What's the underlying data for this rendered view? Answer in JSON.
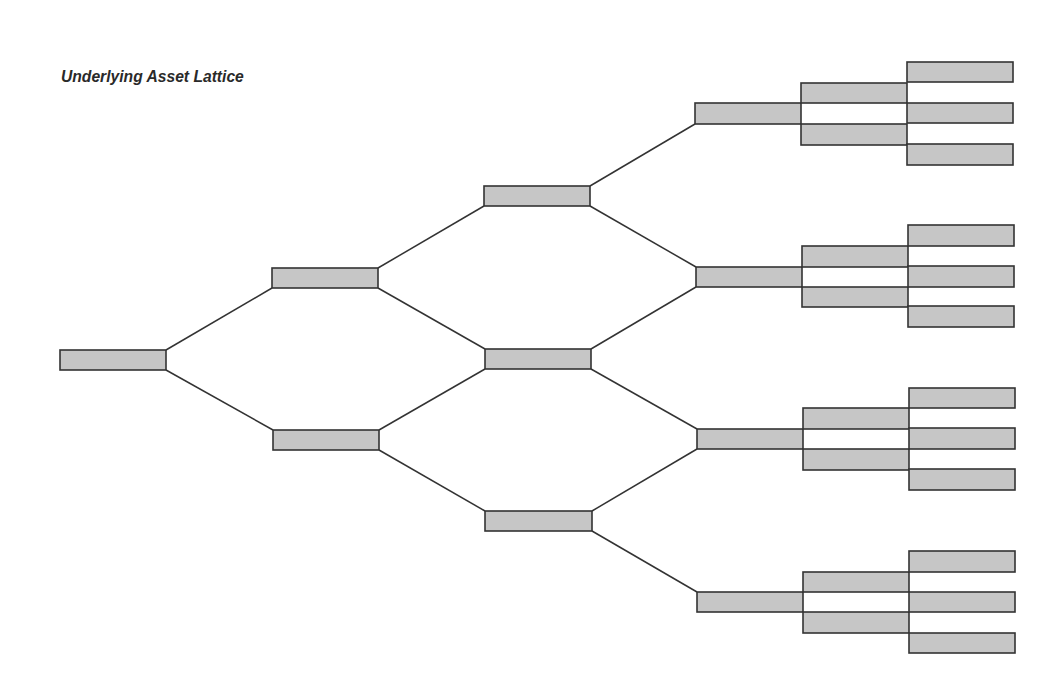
{
  "title": "Underlying Asset Lattice",
  "colors": {
    "node_fill": "#c6c6c6",
    "node_stroke": "#333333",
    "edge": "#333333",
    "background": "#ffffff"
  },
  "lattice": {
    "type": "binomial-to-trinomial tree",
    "levels": 6,
    "nodes": [
      {
        "id": "L0",
        "x": 60,
        "y": 350,
        "w": 106,
        "h": 20
      },
      {
        "id": "L1-up",
        "x": 272,
        "y": 268,
        "w": 106,
        "h": 20
      },
      {
        "id": "L1-down",
        "x": 273,
        "y": 430,
        "w": 106,
        "h": 20
      },
      {
        "id": "L2-up",
        "x": 484,
        "y": 186,
        "w": 106,
        "h": 20
      },
      {
        "id": "L2-mid",
        "x": 485,
        "y": 349,
        "w": 106,
        "h": 20
      },
      {
        "id": "L2-down",
        "x": 485,
        "y": 511,
        "w": 107,
        "h": 20
      },
      {
        "id": "L3-1",
        "x": 695,
        "y": 103,
        "w": 106,
        "h": 21
      },
      {
        "id": "L3-2",
        "x": 696,
        "y": 267,
        "w": 106,
        "h": 20
      },
      {
        "id": "L3-3",
        "x": 697,
        "y": 429,
        "w": 106,
        "h": 20
      },
      {
        "id": "L3-4",
        "x": 697,
        "y": 592,
        "w": 106,
        "h": 20
      },
      {
        "id": "L4-1a",
        "x": 801,
        "y": 83,
        "w": 106,
        "h": 20
      },
      {
        "id": "L4-1b",
        "x": 801,
        "y": 124,
        "w": 106,
        "h": 21
      },
      {
        "id": "L4-2a",
        "x": 802,
        "y": 246,
        "w": 106,
        "h": 21
      },
      {
        "id": "L4-2b",
        "x": 802,
        "y": 287,
        "w": 106,
        "h": 20
      },
      {
        "id": "L4-3a",
        "x": 803,
        "y": 408,
        "w": 106,
        "h": 21
      },
      {
        "id": "L4-3b",
        "x": 803,
        "y": 449,
        "w": 106,
        "h": 21
      },
      {
        "id": "L4-4a",
        "x": 803,
        "y": 572,
        "w": 106,
        "h": 20
      },
      {
        "id": "L4-4b",
        "x": 803,
        "y": 612,
        "w": 106,
        "h": 21
      },
      {
        "id": "L5-1a",
        "x": 907,
        "y": 62,
        "w": 106,
        "h": 20
      },
      {
        "id": "L5-1b",
        "x": 907,
        "y": 103,
        "w": 106,
        "h": 20
      },
      {
        "id": "L5-1c",
        "x": 907,
        "y": 144,
        "w": 106,
        "h": 21
      },
      {
        "id": "L5-2a",
        "x": 908,
        "y": 225,
        "w": 106,
        "h": 21
      },
      {
        "id": "L5-2b",
        "x": 908,
        "y": 266,
        "w": 106,
        "h": 21
      },
      {
        "id": "L5-2c",
        "x": 908,
        "y": 306,
        "w": 106,
        "h": 21
      },
      {
        "id": "L5-3a",
        "x": 909,
        "y": 388,
        "w": 106,
        "h": 20
      },
      {
        "id": "L5-3b",
        "x": 909,
        "y": 428,
        "w": 106,
        "h": 21
      },
      {
        "id": "L5-3c",
        "x": 909,
        "y": 469,
        "w": 106,
        "h": 21
      },
      {
        "id": "L5-4a",
        "x": 909,
        "y": 551,
        "w": 106,
        "h": 21
      },
      {
        "id": "L5-4b",
        "x": 909,
        "y": 592,
        "w": 106,
        "h": 20
      },
      {
        "id": "L5-4c",
        "x": 909,
        "y": 633,
        "w": 106,
        "h": 20
      }
    ],
    "edges": [
      {
        "x1": 166,
        "y1": 350,
        "x2": 272,
        "y2": 288
      },
      {
        "x1": 166,
        "y1": 370,
        "x2": 273,
        "y2": 430
      },
      {
        "x1": 378,
        "y1": 268,
        "x2": 484,
        "y2": 206
      },
      {
        "x1": 378,
        "y1": 288,
        "x2": 485,
        "y2": 349
      },
      {
        "x1": 379,
        "y1": 430,
        "x2": 485,
        "y2": 369
      },
      {
        "x1": 379,
        "y1": 450,
        "x2": 485,
        "y2": 511
      },
      {
        "x1": 590,
        "y1": 186,
        "x2": 695,
        "y2": 124
      },
      {
        "x1": 590,
        "y1": 206,
        "x2": 696,
        "y2": 267
      },
      {
        "x1": 591,
        "y1": 349,
        "x2": 696,
        "y2": 287
      },
      {
        "x1": 591,
        "y1": 369,
        "x2": 697,
        "y2": 429
      },
      {
        "x1": 592,
        "y1": 511,
        "x2": 697,
        "y2": 449
      },
      {
        "x1": 592,
        "y1": 531,
        "x2": 697,
        "y2": 592
      }
    ]
  }
}
